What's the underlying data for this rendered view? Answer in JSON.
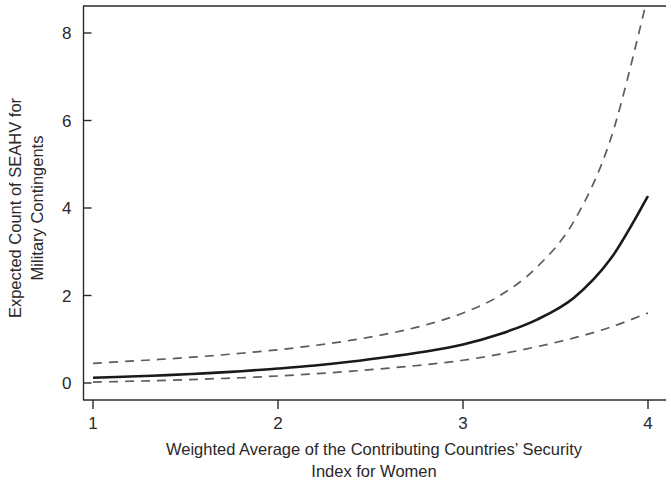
{
  "chart_data": {
    "type": "line",
    "title": "",
    "subtitle": "",
    "xlabel_line1": "Weighted Average of the Contributing Countries’ Security",
    "xlabel_line2": "Index for Women",
    "ylabel_line1": "Expected Count of SEAHV for",
    "ylabel_line2": "Military Contingents",
    "xlim": [
      1,
      4
    ],
    "ylim": [
      0,
      8.9
    ],
    "xticks": [
      1,
      2,
      3,
      4
    ],
    "xtick_labels": [
      "1",
      "2",
      "3",
      "4"
    ],
    "yticks": [
      0,
      2,
      4,
      6,
      8
    ],
    "ytick_labels": [
      "0",
      "2",
      "4",
      "6",
      "8"
    ],
    "grid": false,
    "legend": "none",
    "x": [
      1.0,
      1.2,
      1.4,
      1.6,
      1.8,
      2.0,
      2.2,
      2.4,
      2.6,
      2.8,
      3.0,
      3.2,
      3.4,
      3.6,
      3.8,
      4.0
    ],
    "series": [
      {
        "name": "Expected count (predicted)",
        "style": "solid",
        "color": "#1a1a1a",
        "width": 2.6,
        "values": [
          0.12,
          0.15,
          0.18,
          0.22,
          0.27,
          0.33,
          0.4,
          0.49,
          0.6,
          0.72,
          0.88,
          1.12,
          1.45,
          1.95,
          2.85,
          4.27
        ]
      },
      {
        "name": "Upper 95% confidence bound",
        "style": "dashed",
        "color": "#5c5c5c",
        "width": 1.7,
        "values": [
          0.45,
          0.5,
          0.55,
          0.61,
          0.68,
          0.76,
          0.86,
          0.98,
          1.13,
          1.33,
          1.6,
          2.0,
          2.65,
          3.7,
          5.6,
          8.85
        ]
      },
      {
        "name": "Lower 95% confidence bound",
        "style": "dashed",
        "color": "#5c5c5c",
        "width": 1.7,
        "values": [
          0.02,
          0.04,
          0.06,
          0.09,
          0.12,
          0.16,
          0.21,
          0.27,
          0.34,
          0.42,
          0.52,
          0.66,
          0.83,
          1.03,
          1.28,
          1.6
        ]
      }
    ],
    "annotations": []
  },
  "figure": {
    "background_color": "#ffffff",
    "axis_color": "#2b2829",
    "text_color": "#2b2829"
  }
}
